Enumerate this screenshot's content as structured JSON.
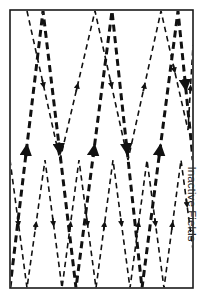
{
  "figure": {
    "label": "Inactive Fields",
    "frame": {
      "x": 10,
      "y": 10,
      "width": 183,
      "height": 278,
      "stroke_color": "#1a1a1a",
      "stroke_width": 1.6,
      "fill_color": "#ffffff"
    },
    "style": {
      "background": "#ffffff",
      "line_color": "#111111",
      "label_color": "#2a2a2a"
    }
  },
  "chart_data": {
    "type": "line",
    "title": "",
    "xlabel": "",
    "ylabel": "Inactive Fields",
    "grid": false,
    "legend": null,
    "xlim": [
      10,
      193
    ],
    "ylim": [
      10,
      288
    ],
    "annotations": [
      "Upward arrowheads on ascending (retrace) segments",
      "Downward arrowheads on descending (trace) segments"
    ],
    "series": [
      {
        "name": "primary-scan-field",
        "style": "dashed",
        "stroke_width": 3.0,
        "color": "#111111",
        "arrow_count": 10,
        "points": [
          [
            10,
            288
          ],
          [
            43,
            11
          ],
          [
            76,
            288
          ],
          [
            112,
            11
          ],
          [
            142,
            288
          ],
          [
            178,
            11
          ],
          [
            193,
            160
          ],
          [
            193,
            160
          ]
        ]
      },
      {
        "name": "secondary-scan-field",
        "style": "dashed",
        "stroke_width": 1.6,
        "color": "#111111",
        "arrow_count": 9,
        "points": [
          [
            10,
            160
          ],
          [
            27,
            288
          ],
          [
            45,
            160
          ],
          [
            62,
            288
          ],
          [
            79,
            160
          ],
          [
            96,
            288
          ],
          [
            113,
            160
          ],
          [
            130,
            288
          ],
          [
            147,
            160
          ],
          [
            164,
            288
          ],
          [
            181,
            160
          ],
          [
            193,
            250
          ]
        ]
      },
      {
        "name": "upper-fine-scan-field",
        "style": "dashed",
        "stroke_width": 1.6,
        "color": "#111111",
        "arrow_count": 6,
        "points": [
          [
            27,
            11
          ],
          [
            60,
            160
          ],
          [
            95,
            11
          ],
          [
            128,
            160
          ],
          [
            161,
            11
          ],
          [
            188,
            130
          ],
          [
            193,
            45
          ]
        ]
      }
    ]
  }
}
